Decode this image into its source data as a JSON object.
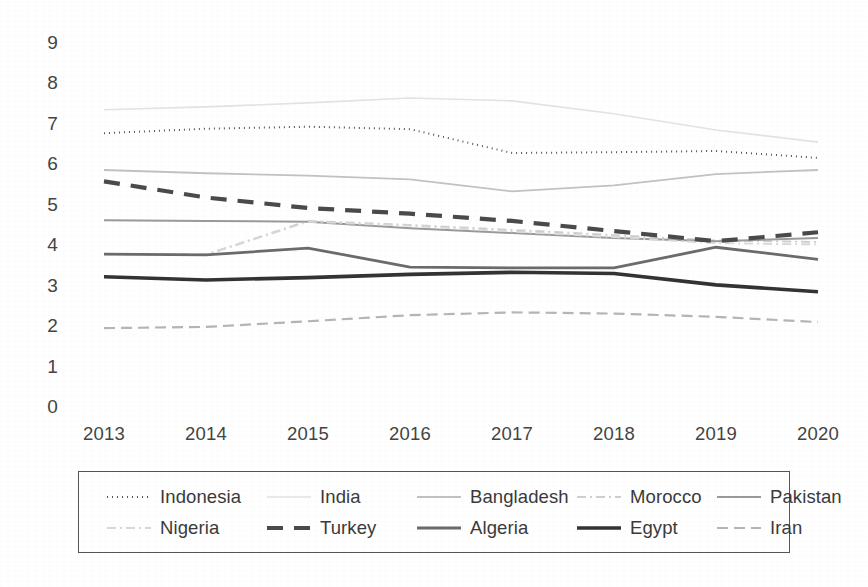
{
  "chart_data": {
    "type": "line",
    "title": "",
    "subtitle": "",
    "xlabel": "",
    "ylabel": "",
    "categories": [
      "2013",
      "2014",
      "2015",
      "2016",
      "2017",
      "2018",
      "2019",
      "2020"
    ],
    "x": [
      2013,
      2014,
      2015,
      2016,
      2017,
      2018,
      2019,
      2020
    ],
    "ylim": [
      0,
      9
    ],
    "ytick_labels": [
      "9",
      "8",
      "7",
      "6",
      "5",
      "4",
      "3",
      "2",
      "1",
      "0"
    ],
    "ytick_values": [
      9,
      8,
      7,
      6,
      5,
      4,
      3,
      2,
      1,
      0
    ],
    "grid": false,
    "legend_position": "bottom",
    "legend_rows": 2,
    "legend_columns": 5,
    "series": [
      {
        "name": "Indonesia",
        "style": "dotted",
        "color": "#555555",
        "width": 2.0,
        "dash": "1,4",
        "values": [
          6.77,
          6.88,
          6.93,
          6.87,
          6.28,
          6.3,
          6.33,
          6.16
        ]
      },
      {
        "name": "India",
        "style": "solid",
        "color": "#e3e3e3",
        "width": 1.6,
        "dash": "",
        "values": [
          7.35,
          7.42,
          7.52,
          7.64,
          7.57,
          7.25,
          6.85,
          6.55
        ]
      },
      {
        "name": "Bangladesh",
        "style": "solid",
        "color": "#c2c2c2",
        "width": 1.8,
        "dash": "",
        "values": [
          5.86,
          5.78,
          5.72,
          5.63,
          5.33,
          5.48,
          5.76,
          5.86
        ]
      },
      {
        "name": "Morocco",
        "style": "dash-dot",
        "color": "#cfcfcf",
        "width": 1.9,
        "dash": "9,4,2,4",
        "values": [
          3.78,
          3.77,
          4.6,
          4.5,
          4.38,
          4.25,
          4.12,
          4.08
        ]
      },
      {
        "name": "Pakistan",
        "style": "solid",
        "color": "#9a9a9a",
        "width": 2.0,
        "dash": "",
        "values": [
          4.62,
          4.6,
          4.58,
          4.42,
          4.3,
          4.18,
          4.1,
          4.18
        ]
      },
      {
        "name": "Nigeria",
        "style": "dash-dot",
        "color": "#d8d8d8",
        "width": 1.9,
        "dash": "9,4,2,4",
        "values": [
          3.78,
          3.76,
          4.58,
          4.48,
          4.34,
          4.2,
          4.05,
          4.02
        ]
      },
      {
        "name": "Turkey",
        "style": "dashed-bold",
        "color": "#4a4a4a",
        "width": 4.2,
        "dash": "16,11",
        "values": [
          5.58,
          5.18,
          4.92,
          4.78,
          4.6,
          4.35,
          4.1,
          4.32
        ]
      },
      {
        "name": "Algeria",
        "style": "solid",
        "color": "#6b6b6b",
        "width": 2.8,
        "dash": "",
        "values": [
          3.78,
          3.76,
          3.93,
          3.46,
          3.44,
          3.44,
          3.95,
          3.65
        ]
      },
      {
        "name": "Egypt",
        "style": "solid-bold",
        "color": "#333333",
        "width": 3.6,
        "dash": "",
        "values": [
          3.22,
          3.14,
          3.2,
          3.28,
          3.33,
          3.3,
          3.02,
          2.85
        ]
      },
      {
        "name": "Iran",
        "style": "dashed",
        "color": "#b5b5b5",
        "width": 2.2,
        "dash": "11,6",
        "values": [
          1.95,
          1.98,
          2.12,
          2.27,
          2.34,
          2.31,
          2.23,
          2.1
        ]
      }
    ]
  },
  "legend": {
    "row1": [
      "Indonesia",
      "India",
      "Bangladesh",
      "Morocco",
      "Pakistan"
    ],
    "row2": [
      "Nigeria",
      "Turkey",
      "Algeria",
      "Egypt",
      "Iran"
    ]
  },
  "colors": {
    "axis_text": "#444444",
    "legend_border": "#555555",
    "background": "#ffffff"
  }
}
